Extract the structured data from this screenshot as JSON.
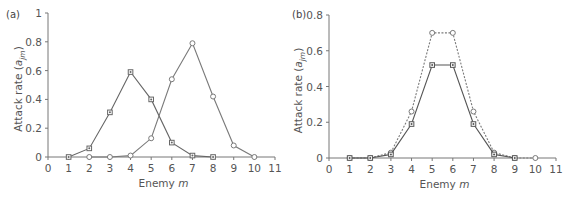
{
  "chart_data": [
    {
      "panel": "(a)",
      "type": "line",
      "xlabel": "Enemy m",
      "ylabel": "Attack rate (a_jm)",
      "xlim": [
        0,
        11
      ],
      "ylim": [
        0,
        1
      ],
      "xticks": [
        "0",
        "1",
        "2",
        "3",
        "4",
        "5",
        "6",
        "7",
        "8",
        "9",
        "10",
        "11"
      ],
      "yticks": [
        "0",
        "0.2",
        "0.4",
        "0.6",
        "0.8",
        "1"
      ],
      "grid": false,
      "series": [
        {
          "name": "square markers (peak at m=4)",
          "marker": "square",
          "line": "solid",
          "color": "#666666",
          "x": [
            1,
            2,
            3,
            4,
            5,
            6,
            7,
            8
          ],
          "values": [
            0.0,
            0.06,
            0.31,
            0.59,
            0.4,
            0.1,
            0.01,
            0.0
          ]
        },
        {
          "name": "circle markers (peak at m=7)",
          "marker": "circle",
          "line": "solid",
          "color": "#7a7a7a",
          "x": [
            2,
            3,
            4,
            5,
            6,
            7,
            8,
            9,
            10
          ],
          "values": [
            0.0,
            0.0,
            0.01,
            0.13,
            0.54,
            0.79,
            0.42,
            0.08,
            0.0
          ]
        }
      ]
    },
    {
      "panel": "(b)",
      "type": "line",
      "xlabel": "Enemy m",
      "ylabel": "Attack rate (a_jm)",
      "xlim": [
        0,
        11
      ],
      "ylim": [
        0,
        0.8
      ],
      "xticks": [
        "0",
        "1",
        "2",
        "3",
        "4",
        "5",
        "6",
        "7",
        "8",
        "9",
        "10",
        "11"
      ],
      "yticks": [
        "0",
        "0.2",
        "0.4",
        "0.6",
        "0.8"
      ],
      "grid": false,
      "series": [
        {
          "name": "dashed upper curve",
          "marker": "circle",
          "line": "dashed",
          "color": "#7a7a7a",
          "x": [
            1,
            2,
            3,
            4,
            5,
            6,
            7,
            8,
            9,
            10
          ],
          "values": [
            0.0,
            0.0,
            0.03,
            0.26,
            0.7,
            0.7,
            0.26,
            0.03,
            0.0,
            0.0
          ]
        },
        {
          "name": "solid lower curve",
          "marker": "square",
          "line": "solid",
          "color": "#555555",
          "x": [
            1,
            2,
            3,
            4,
            5,
            6,
            7,
            8,
            9
          ],
          "values": [
            0.0,
            0.0,
            0.02,
            0.19,
            0.52,
            0.52,
            0.19,
            0.02,
            0.0
          ]
        }
      ]
    }
  ],
  "labels": {
    "panel_a": "(a)",
    "panel_b": "(b)",
    "xlabel_prefix": "Enemy ",
    "xlabel_var": "m",
    "ylabel_prefix": "Attack rate (",
    "ylabel_var": "a",
    "ylabel_sub": "jm",
    "ylabel_suffix": ")"
  }
}
